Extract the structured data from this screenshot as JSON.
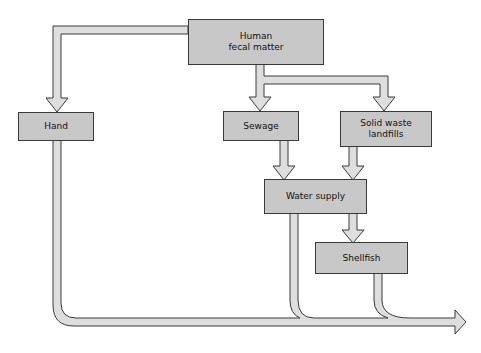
{
  "diagram": {
    "type": "flowchart",
    "colors": {
      "box_fill": "#c8c8c8",
      "pipe_fill": "#dedede",
      "outline": "#3a3a3a",
      "background": "#ffffff"
    },
    "nodes": [
      {
        "id": "human",
        "label": "Human\nfecal matter"
      },
      {
        "id": "hand",
        "label": "Hand"
      },
      {
        "id": "sewage",
        "label": "Sewage"
      },
      {
        "id": "landfill",
        "label": "Solid waste\nlandfills"
      },
      {
        "id": "water",
        "label": "Water supply"
      },
      {
        "id": "shellfish",
        "label": "Shellfish"
      }
    ],
    "edges": [
      {
        "from": "human",
        "to": "hand"
      },
      {
        "from": "human",
        "to": "sewage"
      },
      {
        "from": "human",
        "to": "landfill"
      },
      {
        "from": "sewage",
        "to": "water"
      },
      {
        "from": "landfill",
        "to": "water"
      },
      {
        "from": "water",
        "to": "shellfish"
      },
      {
        "from": "hand",
        "to": "output"
      },
      {
        "from": "water",
        "to": "output"
      },
      {
        "from": "shellfish",
        "to": "output"
      }
    ]
  }
}
